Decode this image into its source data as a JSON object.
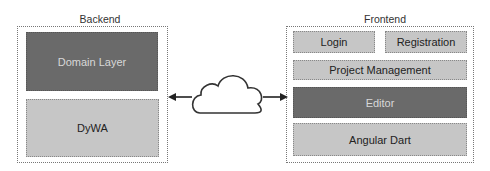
{
  "backend": {
    "title": "Backend",
    "layers": [
      {
        "label": "Domain Layer",
        "style": "dark"
      },
      {
        "label": "DyWA",
        "style": "light"
      }
    ]
  },
  "frontend": {
    "title": "Frontend",
    "layers": [
      {
        "label": "Login",
        "style": "light"
      },
      {
        "label": "Registration",
        "style": "light"
      },
      {
        "label": "Project Management",
        "style": "light"
      },
      {
        "label": "Editor",
        "style": "dark"
      },
      {
        "label": "Angular Dart",
        "style": "light"
      }
    ]
  },
  "connector": {
    "icon": "cloud-icon",
    "direction": "bidirectional"
  },
  "colors": {
    "dark": "#6a6a6a",
    "light": "#c6c6c6"
  }
}
